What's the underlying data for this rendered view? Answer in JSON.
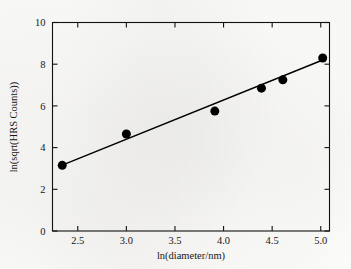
{
  "figure": {
    "background_color": "#fdfdfc",
    "ink_color": "#000000"
  },
  "chart_data": {
    "type": "scatter",
    "title": "",
    "subtitle": "",
    "xlabel": "ln(diameter/nm)",
    "ylabel": "ln(sqrt(HRS Counts))",
    "xlim": [
      2.24,
      5.09
    ],
    "ylim": [
      0,
      10
    ],
    "xticks": [
      2.5,
      3.0,
      3.5,
      4.0,
      4.5,
      5.0
    ],
    "xticklabels": [
      "2.5",
      "3.0",
      "3.5",
      "4.0",
      "4.5",
      "5.0"
    ],
    "yticks": [
      0,
      2,
      4,
      6,
      8,
      10
    ],
    "yticklabels": [
      "0",
      "2",
      "4",
      "6",
      "8",
      "10"
    ],
    "grid": false,
    "legend": null,
    "legend_position": "none",
    "marker": "filled-circle",
    "marker_color": "#000000",
    "marker_size_px": 9,
    "x": [
      2.34,
      3.0,
      3.91,
      4.39,
      4.61,
      5.02
    ],
    "y": [
      3.15,
      4.65,
      5.75,
      6.85,
      7.25,
      8.3
    ],
    "points": [
      {
        "x": 2.34,
        "y": 3.15
      },
      {
        "x": 3.0,
        "y": 4.65
      },
      {
        "x": 3.91,
        "y": 5.75
      },
      {
        "x": 4.39,
        "y": 6.85
      },
      {
        "x": 4.61,
        "y": 7.25
      },
      {
        "x": 5.02,
        "y": 8.3
      }
    ],
    "series": [
      {
        "name": "data",
        "type": "scatter",
        "x": [
          2.34,
          3.0,
          3.91,
          4.39,
          4.61,
          5.02
        ],
        "values": [
          3.15,
          4.65,
          5.75,
          6.85,
          7.25,
          8.3
        ]
      },
      {
        "name": "linear fit",
        "type": "line",
        "x": [
          2.34,
          5.02
        ],
        "values": [
          3.16,
          8.2
        ],
        "slope": 1.88,
        "intercept": -1.24,
        "color": "#000000"
      }
    ],
    "annotations": []
  },
  "axes": {
    "x_title": "ln(diameter/nm)",
    "y_title": "ln(sqrt(HRS Counts))",
    "frame": true,
    "tick_direction": "in"
  }
}
